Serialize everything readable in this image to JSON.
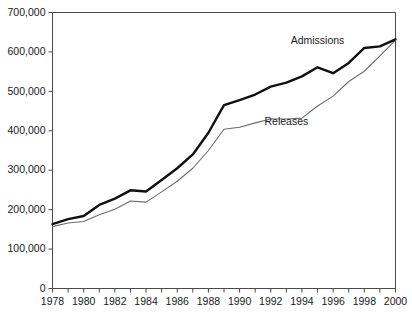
{
  "chart_data": {
    "type": "line",
    "title": "",
    "xlabel": "",
    "ylabel": "",
    "xlim": [
      1978,
      2000
    ],
    "ylim": [
      0,
      700000
    ],
    "grid": false,
    "legend_position": "inline-annotation",
    "y_ticks": [
      0,
      100000,
      200000,
      300000,
      400000,
      500000,
      600000,
      700000
    ],
    "y_tick_labels": [
      "0",
      "100,000",
      "200,000",
      "300,000",
      "400,000",
      "500,000",
      "600,000",
      "700,000"
    ],
    "x_ticks": [
      1978,
      1979,
      1980,
      1981,
      1982,
      1983,
      1984,
      1985,
      1986,
      1987,
      1988,
      1989,
      1990,
      1991,
      1992,
      1993,
      1994,
      1995,
      1996,
      1997,
      1998,
      1999,
      2000
    ],
    "x_tick_labels": [
      "1978",
      "1980",
      "1982",
      "1984",
      "1986",
      "1988",
      "1990",
      "1992",
      "1994",
      "1996",
      "1998",
      "2000"
    ],
    "x_labeled_years": [
      1978,
      1980,
      1982,
      1984,
      1986,
      1988,
      1990,
      1992,
      1994,
      1996,
      1998,
      2000
    ],
    "x": [
      1978,
      1979,
      1980,
      1981,
      1982,
      1983,
      1984,
      1985,
      1986,
      1987,
      1988,
      1989,
      1990,
      1991,
      1992,
      1993,
      1994,
      1995,
      1996,
      1997,
      1998,
      1999,
      2000
    ],
    "series": [
      {
        "name": "Admissions",
        "color": "#101010",
        "line_width": 2.4,
        "label_x": 1995,
        "label_y": 620000,
        "values": [
          163000,
          176000,
          184000,
          212000,
          228000,
          249000,
          246000,
          275000,
          305000,
          340000,
          395000,
          465000,
          478000,
          492000,
          512000,
          522000,
          538000,
          561000,
          546000,
          572000,
          610000,
          614000,
          632000
        ]
      },
      {
        "name": "Releases",
        "color": "#6b6b6b",
        "line_width": 1.1,
        "label_x": 1993,
        "label_y": 415000,
        "values": [
          157000,
          166000,
          170000,
          187000,
          201000,
          222000,
          219000,
          245000,
          272000,
          305000,
          350000,
          404000,
          409000,
          420000,
          430000,
          430000,
          432000,
          463000,
          488000,
          525000,
          551000,
          590000,
          630000
        ]
      }
    ],
    "annotations": [
      {
        "text": "Admissions",
        "x": 1995,
        "y": 620000
      },
      {
        "text": "Releases",
        "x": 1993,
        "y": 415000
      }
    ]
  },
  "colors": {
    "admissions": "#101010",
    "releases": "#6b6b6b",
    "axis": "#4a4a4a",
    "background": "#ffffff"
  }
}
